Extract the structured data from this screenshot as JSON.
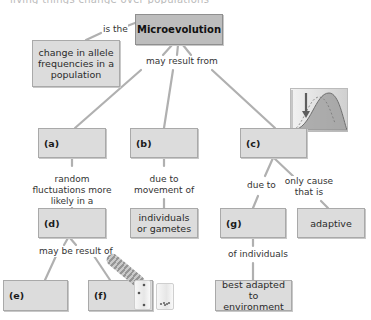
{
  "cutoff_header": "living things change over populations",
  "title_node": {
    "label": "Microevolution"
  },
  "definition_node": {
    "label": "change in allele frequencies in a population"
  },
  "links": {
    "is_the": "is the",
    "may_result_from": "may result from",
    "random_fluctuations": "random fluctuations more likely in a",
    "due_to_movement": "due to movement of",
    "due_to": "due to",
    "only_cause": "only cause that is",
    "may_be_result_of": "may be result of",
    "of_individuals": "of individuals"
  },
  "nodes": {
    "a": "(a)",
    "b": "(b)",
    "c": "(c)",
    "d": "(d)",
    "e": "(e)",
    "f": "(f)",
    "g": "(g)",
    "individuals_or_gametes": "individuals or gametes",
    "adaptive": "adaptive",
    "best_adapted": "best adapted to environment"
  },
  "figures": {
    "selection_graph": "bell-curve-shift-graph",
    "bottleneck_bottle": "bottle-pouring-beads",
    "small_jar": "small-jar-beads"
  },
  "colors": {
    "box_fill": "#dcdcdc",
    "title_fill": "#bdbdbd",
    "line": "#b0b0b0",
    "curve": "#7a7a7a",
    "arrow": "#6b6b6b"
  }
}
